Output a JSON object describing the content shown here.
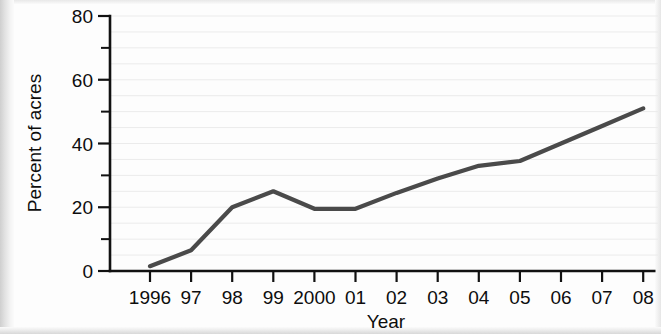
{
  "chart_data": {
    "type": "line",
    "title": "",
    "xlabel": "Year",
    "ylabel": "Percent of acres",
    "categories": [
      "1996",
      "97",
      "98",
      "99",
      "2000",
      "01",
      "02",
      "03",
      "04",
      "05",
      "06",
      "07",
      "08"
    ],
    "x": [
      1996,
      1997,
      1998,
      1999,
      2000,
      2001,
      2002,
      2003,
      2004,
      2005,
      2006,
      2007,
      2008
    ],
    "values": [
      1.5,
      6.5,
      20,
      25,
      19.5,
      19.5,
      24.5,
      29,
      33,
      34.5,
      40,
      45.5,
      51
    ],
    "series": [
      {
        "name": "Percent of acres",
        "values": [
          1.5,
          6.5,
          20,
          25,
          19.5,
          19.5,
          24.5,
          29,
          33,
          34.5,
          40,
          45.5,
          51
        ],
        "color": "#4a4a4a"
      }
    ],
    "ylim": [
      0,
      80
    ],
    "y_major_ticks": [
      0,
      20,
      40,
      60,
      80
    ],
    "y_major_tick_labels": [
      "0",
      "20",
      "40",
      "60",
      "80"
    ],
    "y_minor_ticks": [
      10,
      30,
      50,
      70
    ],
    "grid": true,
    "grid_axis": "y",
    "grid_interval": 5,
    "legend": "none",
    "line_color": "#4a4a4a",
    "axis_color": "#111111",
    "background_color": "#fdfdfd"
  },
  "axes": {
    "y_title": "Percent of acres",
    "x_title": "Year"
  }
}
